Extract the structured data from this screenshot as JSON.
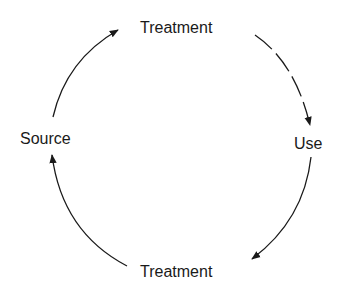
{
  "diagram": {
    "type": "cycle",
    "nodes": [
      {
        "id": "top",
        "label": "Treatment"
      },
      {
        "id": "use",
        "label": "Use"
      },
      {
        "id": "bottom",
        "label": "Treatment"
      },
      {
        "id": "source",
        "label": "Source"
      }
    ],
    "edges": [
      {
        "from": "source",
        "to": "top"
      },
      {
        "from": "top",
        "to": "use"
      },
      {
        "from": "use",
        "to": "bottom"
      },
      {
        "from": "bottom",
        "to": "source"
      }
    ],
    "colors": {
      "stroke": "#1a1a1a",
      "background": "#ffffff"
    }
  }
}
